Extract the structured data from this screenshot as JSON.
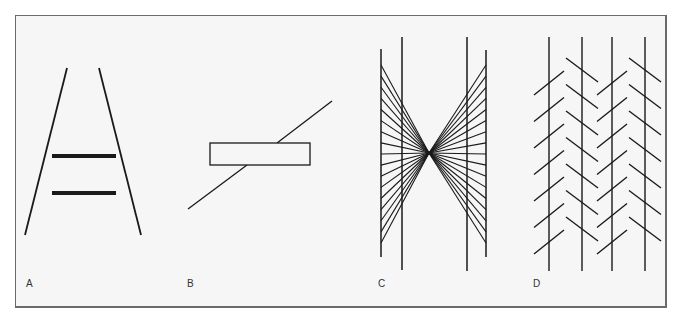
{
  "figure": {
    "panels": [
      {
        "id": "A",
        "label": "A",
        "name": "ponzo-illusion"
      },
      {
        "id": "B",
        "label": "B",
        "name": "poggendorff-illusion"
      },
      {
        "id": "C",
        "label": "C",
        "name": "hering-illusion"
      },
      {
        "id": "D",
        "label": "D",
        "name": "zollner-illusion"
      }
    ],
    "colors": {
      "line": "#1a1a1a",
      "background": "#f6f6f6",
      "border": "#6a6a6a"
    }
  }
}
